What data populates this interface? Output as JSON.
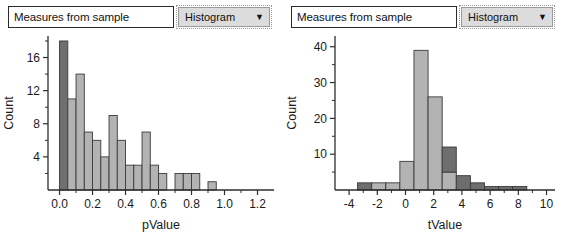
{
  "panels": [
    {
      "id": "left",
      "textbox": {
        "value": "Measures from sample"
      },
      "dropdown": {
        "value": "Histogram",
        "caret": "▼"
      }
    },
    {
      "id": "right",
      "textbox": {
        "value": "Measures from sample"
      },
      "dropdown": {
        "value": "Histogram",
        "caret": "▼"
      }
    }
  ],
  "colors": {
    "bar_dark": "#6e6e6e",
    "bar_light": "#b3b3b3",
    "bar_edge": "#3a3a3a",
    "axis": "#2d2d2d",
    "text": "#1a1a1a",
    "dropdown_face": "#dcdcdc",
    "textbox_border": "#2b2b2b"
  },
  "chart_data": [
    {
      "type": "bar",
      "id": "pvalue-histogram",
      "title": "",
      "xlabel": "pValue",
      "ylabel": "Count",
      "xlim": [
        -0.07,
        1.3
      ],
      "ylim": [
        0,
        18.6
      ],
      "xticks": [
        "0.0",
        "0.2",
        "0.4",
        "0.6",
        "0.8",
        "1.0",
        "1.2"
      ],
      "xtick_values": [
        0.0,
        0.2,
        0.4,
        0.6,
        0.8,
        1.0,
        1.2
      ],
      "xtick_minor": [
        0.1,
        0.3,
        0.5,
        0.7,
        0.9,
        1.1
      ],
      "yticks": [
        "4",
        "8",
        "12",
        "16"
      ],
      "ytick_values": [
        4,
        8,
        12,
        16
      ],
      "ytick_minor": [
        2,
        6,
        10,
        14,
        18
      ],
      "grid": false,
      "legend": "none",
      "bin_width": 0.05,
      "bin_starts": [
        0.0,
        0.05,
        0.1,
        0.15,
        0.2,
        0.25,
        0.3,
        0.35,
        0.4,
        0.45,
        0.5,
        0.55,
        0.6,
        0.7,
        0.75,
        0.8,
        0.9
      ],
      "values": [
        18,
        11,
        14,
        7,
        6,
        4,
        9,
        6,
        3,
        3,
        7,
        3,
        2,
        2,
        2,
        2,
        1
      ],
      "shades": [
        "dark",
        "light",
        "light",
        "light",
        "light",
        "light",
        "light",
        "light",
        "light",
        "light",
        "light",
        "light",
        "light",
        "light",
        "light",
        "light",
        "light"
      ]
    },
    {
      "type": "bar",
      "id": "tvalue-histogram",
      "title": "",
      "xlabel": "tValue",
      "ylabel": "Count",
      "xlim": [
        -5.0,
        10.6
      ],
      "ylim": [
        0,
        43
      ],
      "xticks": [
        "-4",
        "-2",
        "0",
        "2",
        "4",
        "6",
        "8",
        "10"
      ],
      "xtick_values": [
        -4,
        -2,
        0,
        2,
        4,
        6,
        8,
        10
      ],
      "xtick_minor": [
        -3,
        -1,
        1,
        3,
        5,
        7,
        9
      ],
      "yticks": [
        "10",
        "20",
        "30",
        "40"
      ],
      "ytick_values": [
        10,
        20,
        30,
        40
      ],
      "ytick_minor": [
        5,
        15,
        25,
        35
      ],
      "grid": false,
      "legend": "none",
      "bin_width": 1,
      "bins": [
        {
          "start": -3.4,
          "end": -2.4,
          "total": 2,
          "dark": 2,
          "light": 0
        },
        {
          "start": -2.4,
          "end": -1.4,
          "total": 2,
          "dark": 0,
          "light": 2
        },
        {
          "start": -1.4,
          "end": -0.4,
          "total": 2,
          "dark": 0,
          "light": 2
        },
        {
          "start": -0.4,
          "end": 0.6,
          "total": 8,
          "dark": 0,
          "light": 8
        },
        {
          "start": 0.6,
          "end": 1.6,
          "total": 39,
          "dark": 0,
          "light": 39
        },
        {
          "start": 1.6,
          "end": 2.6,
          "total": 26,
          "dark": 0,
          "light": 26
        },
        {
          "start": 2.6,
          "end": 3.6,
          "total": 12,
          "dark": 7,
          "light": 5
        },
        {
          "start": 3.6,
          "end": 4.6,
          "total": 4,
          "dark": 4,
          "light": 0
        },
        {
          "start": 4.6,
          "end": 5.6,
          "total": 2,
          "dark": 2,
          "light": 0
        },
        {
          "start": 5.6,
          "end": 6.6,
          "total": 1,
          "dark": 1,
          "light": 0
        },
        {
          "start": 6.6,
          "end": 7.6,
          "total": 1,
          "dark": 1,
          "light": 0
        },
        {
          "start": 7.6,
          "end": 8.6,
          "total": 1,
          "dark": 1,
          "light": 0
        }
      ]
    }
  ]
}
